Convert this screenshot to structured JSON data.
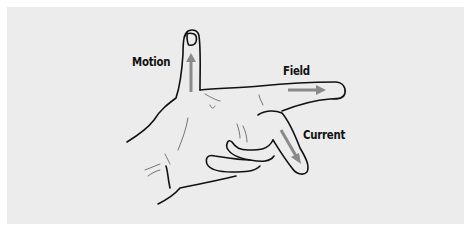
{
  "diagram": {
    "colors": {
      "background": "#ececec",
      "outline": "#111111",
      "arrow": "#8a8a8a",
      "label": "#111111"
    },
    "labels": {
      "motion": "Motion",
      "field": "Field",
      "current": "Current"
    },
    "arrows": [
      {
        "name": "motion",
        "direction": "up"
      },
      {
        "name": "field",
        "direction": "right"
      },
      {
        "name": "current",
        "direction": "down-right"
      }
    ]
  }
}
